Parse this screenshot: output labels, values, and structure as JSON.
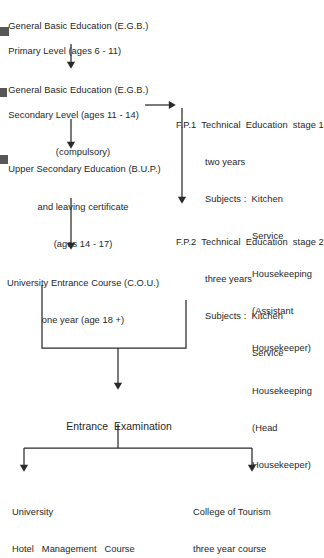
{
  "diagram": {
    "stroke_color": "#2b2b2b",
    "background_color": "#ffffff",
    "nodes": {
      "egb_primary": {
        "lines": [
          "General Basic Education (E.G.B.)",
          "Primary Level (ages 6 - 11)"
        ]
      },
      "egb_secondary": {
        "lines": [
          "General Basic Education (E.G.B.)",
          "Secondary Level (ages 11 - 14)",
          "(compulsory)"
        ]
      },
      "bup": {
        "lines": [
          "Upper Secondary Education (B.U.P.)",
          "and leaving certificate",
          "(ages 14 - 17)"
        ]
      },
      "cou": {
        "lines": [
          "University Entrance Course (C.O.U.)",
          "one year (age 18 +)"
        ]
      },
      "fp1": {
        "head": "F.P.1  Technical  Education  stage 1",
        "duration": "two years",
        "subjects_label": "Subjects :  Kitchen",
        "subjects": [
          "Service",
          "Housekeeping",
          "(Assistant",
          "Housekeeper)"
        ]
      },
      "fp2": {
        "head": "F.P.2  Technical  Education  stage 2",
        "duration": "three years",
        "subjects_label": "Subjects :  Kitchen",
        "subjects": [
          "Service",
          "Housekeeping",
          "(Head",
          "Housekeeper)"
        ]
      },
      "entrance_exam": {
        "lines": [
          "Entrance  Examination"
        ]
      },
      "university": {
        "lines": [
          "University",
          "Hotel   Management   Course"
        ]
      },
      "college": {
        "lines": [
          "College of Tourism",
          "three year course"
        ]
      }
    },
    "connectors": [
      {
        "name": "egb-primary-to-egb-secondary",
        "type": "arrow-down"
      },
      {
        "name": "egb-secondary-to-bup",
        "type": "arrow-down"
      },
      {
        "name": "egb-secondary-to-fp1",
        "type": "arrow-right"
      },
      {
        "name": "bup-to-cou",
        "type": "arrow-down"
      },
      {
        "name": "fp1-to-fp2",
        "type": "arrow-down"
      },
      {
        "name": "cou-to-entrance-exam",
        "type": "elbow-merge-down"
      },
      {
        "name": "fp2-to-entrance-exam",
        "type": "elbow-merge-down"
      },
      {
        "name": "entrance-exam-to-university",
        "type": "split-arrow-down-left"
      },
      {
        "name": "entrance-exam-to-college",
        "type": "split-arrow-down-right"
      }
    ]
  }
}
